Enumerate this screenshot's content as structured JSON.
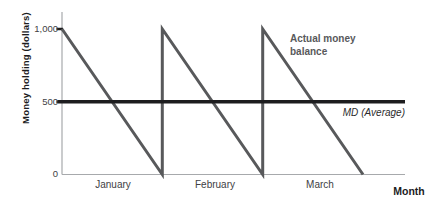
{
  "figure": {
    "y_axis_title": "Money holding (dollars)",
    "x_axis_title": "Month",
    "y_ticks": [
      "1,000",
      "500",
      "0"
    ],
    "x_labels": [
      "January",
      "February",
      "March"
    ],
    "series_label_lines": [
      "Actual money",
      "balance"
    ],
    "avg_label": {
      "variable": "MD",
      "rest": "(Average)"
    }
  },
  "chart_data": {
    "type": "line",
    "title": "",
    "xlabel": "Month",
    "ylabel": "Money holding (dollars)",
    "x_categories": [
      "January",
      "February",
      "March"
    ],
    "ylim": [
      0,
      1000
    ],
    "yticks": [
      0,
      500,
      1000
    ],
    "grid": false,
    "legend_position": "none",
    "series": [
      {
        "name": "Actual money balance",
        "shape": "sawtooth",
        "t_months": [
          0,
          1,
          1,
          2,
          2,
          3
        ],
        "values": [
          1000,
          0,
          1000,
          0,
          1000,
          0
        ],
        "color": "#58595b"
      },
      {
        "name": "MD (Average)",
        "t_months": [
          0,
          3.42
        ],
        "values": [
          500,
          500
        ],
        "color": "#1d1d1f"
      }
    ],
    "annotations": [
      {
        "text": "Actual money balance",
        "bold": true,
        "color": "#58595b"
      },
      {
        "text": "MD (Average)",
        "italic": true,
        "color": "#2b2b2d"
      }
    ]
  },
  "colors": {
    "axis": "#a7a9ac",
    "tick_mark": "#1d1d1f",
    "background": "#ffffff"
  }
}
